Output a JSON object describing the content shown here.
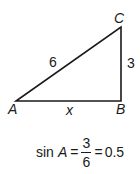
{
  "diagram": {
    "type": "right-triangle",
    "vertices": {
      "A": {
        "label": "A"
      },
      "B": {
        "label": "B"
      },
      "C": {
        "label": "C"
      }
    },
    "sides": {
      "AC": "6",
      "BC": "3",
      "AB": "x"
    },
    "right_angle_at": "B"
  },
  "formula": {
    "func": "sin",
    "angle": "A",
    "equals1": "=",
    "numerator": "3",
    "denominator": "6",
    "equals2": "=",
    "result": "0.5"
  }
}
